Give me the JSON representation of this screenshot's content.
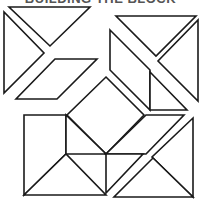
{
  "title": "BUILDING THE BLOCK",
  "stroke_color": "#1a1a1a",
  "background": "#ffffff",
  "pieces": [
    {
      "id": "tl-left-triangle",
      "points": "4,12 4,93 44,53"
    },
    {
      "id": "tl-top-triangle",
      "points": "9,7 90,7 50,46"
    },
    {
      "id": "tl-parallelogram",
      "points": "55,59 97,59 57,99 16,99"
    },
    {
      "id": "tr-top-triangle",
      "points": "116,16 196,16 156,56"
    },
    {
      "id": "tr-right-triangle",
      "points": "198,20 198,101 158,61"
    },
    {
      "id": "tr-parallelogram",
      "points": "110,30 150,70 150,110 110,70"
    },
    {
      "id": "tr-small-triangle",
      "points": "150,72 187,110 150,110"
    },
    {
      "id": "center-diamond",
      "points": "106,77 144,115 106,154 67,115"
    },
    {
      "id": "bl-square-outline",
      "points": "24,115 66,115 66,154 24,195"
    },
    {
      "id": "bl-bottom-triangle",
      "points": "24,195 66,154 106,195"
    },
    {
      "id": "bl-top-right-triangle",
      "points": "66,115 106,154 66,154"
    },
    {
      "id": "br-parallelogram",
      "points": "146,115 184,115 146,154 106,154"
    },
    {
      "id": "br-small-rect-triangle",
      "points": "106,154 143,154 106,193"
    },
    {
      "id": "br-right-triangle",
      "points": "193,118 193,197 152,157"
    },
    {
      "id": "br-bottom-triangle",
      "points": "114,197 193,197 153,158"
    }
  ]
}
